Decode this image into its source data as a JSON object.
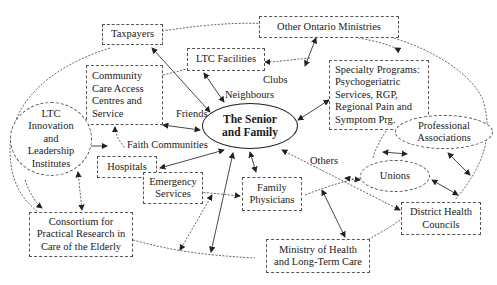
{
  "diagram": {
    "center": {
      "label": "The Senior\nand Family"
    },
    "nodes": {
      "taxpayers": "Taxpayers",
      "other_ministries": "Other Ontario Ministries",
      "ltc_facilities": "LTC Facilities",
      "ccac": "Community\nCare Access\nCentres and\nService",
      "specialty": "Specialty Programs:\nPsychogeriatric\nServices, RGP,\nRegional Pain and\nSymptom Prg.",
      "ltc_innovation": "LTC\nInnovation\nand\nLeadership\nInstitutes",
      "professional": "Professional\nAssociations",
      "unions": "Unions",
      "hospitals": "Hospitals",
      "emergency": "Emergency\nServices",
      "family_physicians": "Family\nPhysicians",
      "district_health": "District Health\nCouncils",
      "consortium": "Consortium for\nPractical Research in\nCare of the Elderly",
      "ministry_health": "Ministry of Health\nand Long-Term Care"
    },
    "labels": {
      "clubs": "Clubs",
      "neighbours": "Neighbours",
      "friends": "Friends",
      "faith": "Faith Communities",
      "others": "Others"
    },
    "colors": {
      "line": "#333333",
      "dashed": "#555555",
      "background": "#ffffff"
    }
  }
}
